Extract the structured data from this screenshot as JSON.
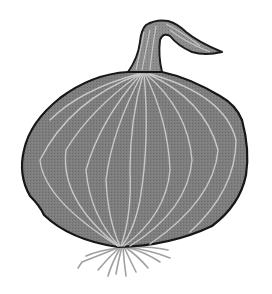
{
  "image": {
    "subject": "onion",
    "style": "grayscale clip-art illustration",
    "colors": {
      "background": "#ffffff",
      "body_fill": "#7a7a7a",
      "outline": "#1a1a1a",
      "veins": "#c8c8c8",
      "roots": "#9a9a9a"
    }
  }
}
